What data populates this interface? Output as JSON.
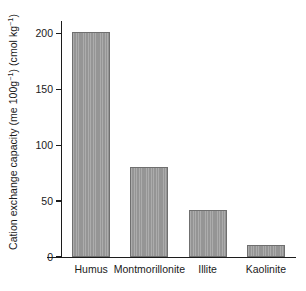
{
  "chart_data": {
    "type": "bar",
    "title": "",
    "xlabel": "",
    "ylabel": "Cation exchange capacity (me 100g⁻¹) (cmol kg⁻¹)",
    "ylabel_parts": {
      "lead": "Cation exchange capacity (me 100g",
      "sup1": "−1",
      "mid": ") (cmol kg",
      "sup2": "−1",
      "tail": ")"
    },
    "categories": [
      "Humus",
      "Montmorillonite",
      "Illite",
      "Kaolinite"
    ],
    "values": [
      201,
      80,
      42,
      11
    ],
    "ylim": [
      0,
      210
    ],
    "yticks": [
      0,
      50,
      100,
      150,
      200
    ],
    "ytick_labels": [
      "0",
      "50",
      "100",
      "150",
      "200"
    ],
    "grid": false,
    "legend": false,
    "legend_position": "none",
    "bar_color": "#959595",
    "bar_edge_color": "#6f6f6f",
    "axis_color": "#1c1c1c",
    "background_color": "#ffffff",
    "units": "cmol kg-1"
  }
}
